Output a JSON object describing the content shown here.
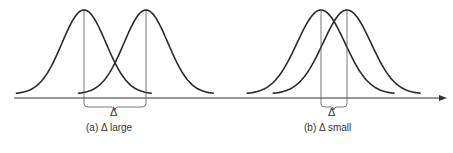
{
  "figure": {
    "axis": {
      "y": 98,
      "x_start": 14,
      "x_end": 447,
      "color": "#333333"
    },
    "panels": [
      {
        "id": "a",
        "caption": "(a)  Δ large",
        "delta_label": "Δ",
        "curves": [
          {
            "mean_x": 84,
            "sigma": 22
          },
          {
            "mean_x": 146,
            "sigma": 22
          }
        ],
        "caption_pos": {
          "x": 88,
          "y": 126
        },
        "delta_pos": {
          "x": 110,
          "y": 108
        }
      },
      {
        "id": "b",
        "caption": "(b)  Δ small",
        "delta_label": "Δ",
        "curves": [
          {
            "mean_x": 321,
            "sigma": 24
          },
          {
            "mean_x": 347,
            "sigma": 24
          }
        ],
        "caption_pos": {
          "x": 305,
          "y": 126
        },
        "delta_pos": {
          "x": 328,
          "y": 108
        }
      }
    ],
    "peak_y": 10,
    "stroke": "#2a2a2a"
  }
}
